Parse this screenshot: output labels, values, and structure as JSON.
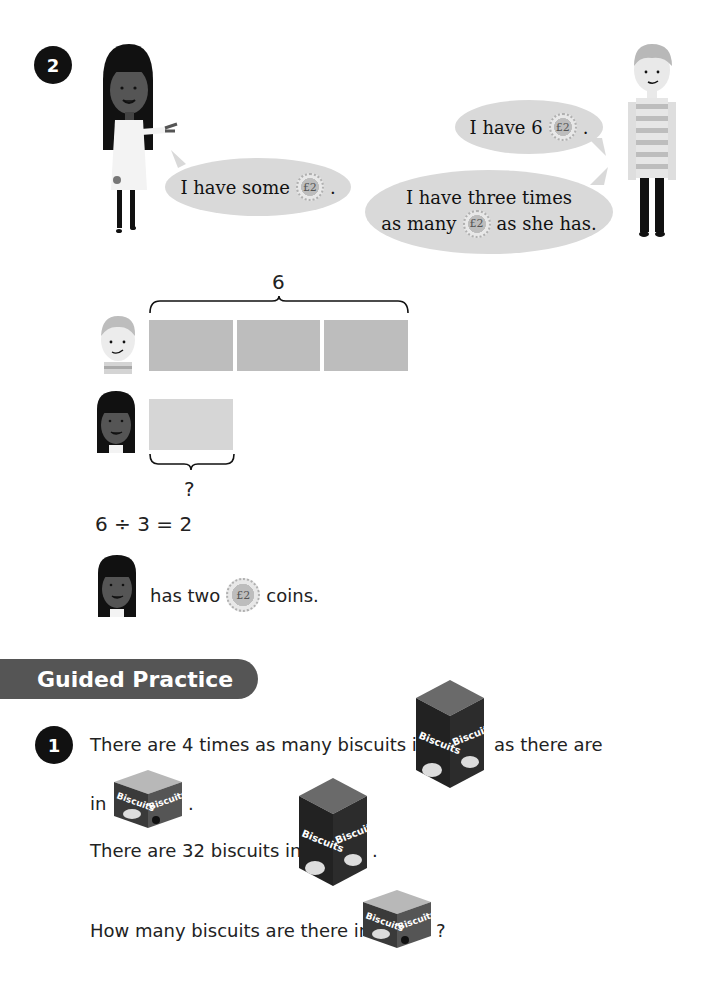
{
  "example": {
    "number": "2",
    "girl_bubble": {
      "text_before": "I have some",
      "coin": "£2",
      "text_after": "."
    },
    "boy_bubble_1": {
      "text_before": "I have 6",
      "coin": "£2",
      "text_after": "."
    },
    "boy_bubble_2": {
      "line1": "I have three times",
      "line2_before": "as many",
      "coin": "£2",
      "line2_after": "as she has."
    }
  },
  "bar_model": {
    "total_label": "6",
    "boy_bars": 3,
    "girl_bars": 1,
    "unknown_label": "?",
    "equation": "6 ÷ 3 = 2",
    "conclusion_before": "has two",
    "coin": "£2",
    "conclusion_after": "coins."
  },
  "guided_practice": {
    "title": "Guided Practice",
    "question": {
      "number": "1",
      "line1_before": "There are 4 times as many biscuits in",
      "line1_after": "as there are",
      "line2_before": "in",
      "line2_after": ".",
      "line3_before": "There are 32 biscuits in",
      "line3_after": ".",
      "line4_before": "How many biscuits are there in",
      "line4_after": "?"
    },
    "box_label": "Biscuits"
  },
  "colors": {
    "badge": "#111111",
    "bubble": "#d9d9d9",
    "bar_boy": "#bdbdbd",
    "bar_girl": "#d6d6d6",
    "section_header": "#555555"
  }
}
